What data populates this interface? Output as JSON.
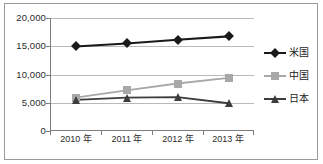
{
  "chart_data": {
    "type": "line",
    "title": "",
    "subtitle": "",
    "xlabel": "",
    "ylabel": "",
    "categories": [
      "2010 年",
      "2011 年",
      "2012 年",
      "2013 年"
    ],
    "ylim": [
      0,
      20000
    ],
    "ytick_labels": [
      "20,000",
      "15,000",
      "10,000",
      "5,000",
      "0"
    ],
    "ytick_values": [
      20000,
      15000,
      10000,
      5000,
      0
    ],
    "grid": true,
    "legend_position": "right",
    "series": [
      {
        "name": "米国",
        "marker": "diamond",
        "color": "#1a1a1a",
        "values": [
          14960,
          15500,
          16150,
          16750
        ]
      },
      {
        "name": "中国",
        "marker": "square",
        "color": "#a8a8a8",
        "values": [
          5900,
          7200,
          8400,
          9400
        ]
      },
      {
        "name": "日本",
        "marker": "triangle",
        "color": "#3d3d3d",
        "values": [
          5500,
          5900,
          6000,
          4900
        ]
      }
    ]
  },
  "axes": {
    "ytick_0": "20,000",
    "ytick_1": "15,000",
    "ytick_2": "10,000",
    "ytick_3": "5,000",
    "ytick_4": "0",
    "xtick_0": "2010 年",
    "xtick_1": "2011 年",
    "xtick_2": "2012 年",
    "xtick_3": "2013 年"
  },
  "legend": {
    "item_0": "米国",
    "item_1": "中国",
    "item_2": "日本"
  },
  "colors": {
    "series_us": "#1a1a1a",
    "series_cn": "#a8a8a8",
    "series_jp": "#3d3d3d",
    "gridline": "#b9b9b9",
    "axis": "#7d7d7d",
    "frame": "#9a9a9a",
    "background": "#ffffff"
  }
}
